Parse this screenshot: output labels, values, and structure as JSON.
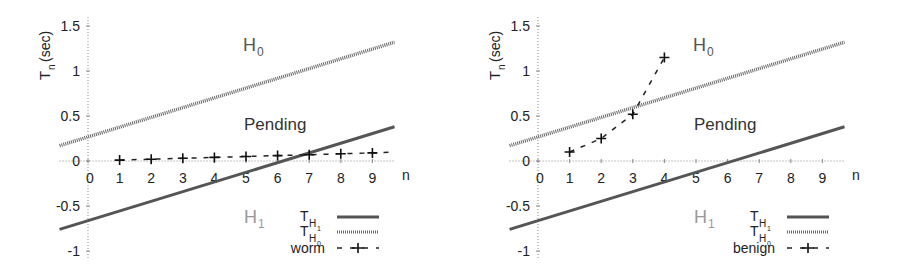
{
  "chart_data": [
    {
      "type": "line",
      "ylabel": "T_n (sec)",
      "ylabel_main": "T",
      "ylabel_sub": "n",
      "ylabel_unit": "(sec)",
      "xlabel": "n",
      "x_ticks": [
        "0",
        "1",
        "2",
        "3",
        "4",
        "5",
        "6",
        "7",
        "8",
        "9"
      ],
      "y_ticks": [
        "1.5",
        "1",
        "0.5",
        "0",
        "-0.5",
        "-1"
      ],
      "xlim": [
        -0.9,
        9.7
      ],
      "ylim": [
        -1.1,
        1.6
      ],
      "grid": "zero-lines dotted",
      "region_labels": {
        "h0": "H",
        "h0_sub": "0",
        "pending": "Pending",
        "h1": "H",
        "h1_sub": "1"
      },
      "series": [
        {
          "name": "T_H1",
          "label_main": "T",
          "label_sub": "H",
          "label_subsub": "1",
          "style": "solid",
          "x": [
            -0.9,
            9.7
          ],
          "y": [
            -0.76,
            0.38
          ]
        },
        {
          "name": "T_H0",
          "label_main": "T",
          "label_sub": "H",
          "label_subsub": "0",
          "style": "dotted-thick",
          "x": [
            -0.9,
            9.7
          ],
          "y": [
            0.17,
            1.32
          ]
        },
        {
          "name": "worm",
          "label_main": "worm",
          "style": "dashed-plus",
          "x": [
            1,
            2,
            3,
            4,
            5,
            6,
            7,
            8,
            9
          ],
          "y": [
            0.01,
            0.02,
            0.03,
            0.04,
            0.05,
            0.06,
            0.07,
            0.08,
            0.09
          ],
          "dash_end": 9.7
        }
      ],
      "legend_position": "lower right"
    },
    {
      "type": "line",
      "ylabel": "T_n (sec)",
      "ylabel_main": "T",
      "ylabel_sub": "n",
      "ylabel_unit": "(sec)",
      "xlabel": "n",
      "x_ticks": [
        "0",
        "1",
        "2",
        "3",
        "4",
        "5",
        "6",
        "7",
        "8",
        "9"
      ],
      "y_ticks": [
        "1.5",
        "1",
        "0.5",
        "0",
        "-0.5",
        "-1"
      ],
      "xlim": [
        -0.9,
        9.7
      ],
      "ylim": [
        -1.1,
        1.6
      ],
      "grid": "zero-lines dotted",
      "region_labels": {
        "h0": "H",
        "h0_sub": "0",
        "pending": "Pending",
        "h1": "H",
        "h1_sub": "1"
      },
      "series": [
        {
          "name": "T_H1",
          "label_main": "T",
          "label_sub": "H",
          "label_subsub": "1",
          "style": "solid",
          "x": [
            -0.9,
            9.7
          ],
          "y": [
            -0.76,
            0.38
          ]
        },
        {
          "name": "T_H0",
          "label_main": "T",
          "label_sub": "H",
          "label_subsub": "0",
          "style": "dotted-thick",
          "x": [
            -0.9,
            9.7
          ],
          "y": [
            0.17,
            1.32
          ]
        },
        {
          "name": "benign",
          "label_main": "benign",
          "style": "dashed-plus",
          "x": [
            1,
            2,
            3,
            4
          ],
          "y": [
            0.1,
            0.25,
            0.52,
            1.15
          ]
        }
      ],
      "legend_position": "lower right"
    }
  ]
}
